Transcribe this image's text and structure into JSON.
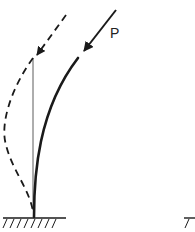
{
  "diagram": {
    "load_label": "P",
    "colors": {
      "stroke": "#1a1a1a",
      "background": "#ffffff"
    },
    "elements": [
      {
        "id": "ground-support",
        "type": "fixed-support-hatching"
      },
      {
        "id": "deflected-column",
        "type": "solid-curve"
      },
      {
        "id": "load-arrow",
        "type": "arrow",
        "label": "P"
      },
      {
        "id": "reference-line",
        "type": "thin-vertical-line"
      },
      {
        "id": "buckled-mode",
        "type": "dashed-curve"
      },
      {
        "id": "buckled-load-arrow",
        "type": "dashed-arrow"
      },
      {
        "id": "second-support-partial",
        "type": "fixed-support-hatching"
      }
    ]
  }
}
